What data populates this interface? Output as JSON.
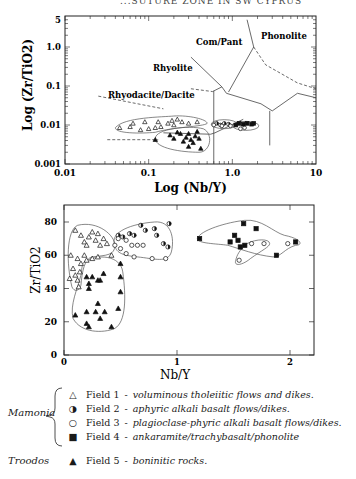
{
  "header": {
    "text": "...SUTURE ZONE IN SW CYPRUS"
  },
  "chart_data": [
    {
      "type": "scatter",
      "title": "",
      "xlabel": "Log (Nb/Y)",
      "ylabel": "Log (Zr/TiO2)",
      "xscale": "log",
      "yscale": "log",
      "xlim": [
        0.01,
        10
      ],
      "ylim": [
        0.001,
        5
      ],
      "x_ticks": [
        "0.01",
        "0.1",
        "1.0",
        "10"
      ],
      "y_ticks": [
        "0.001",
        "0.01",
        "0.1",
        "1.0",
        "5"
      ],
      "grid": false,
      "region_labels": [
        "Phonolite",
        "Com/Pant",
        "Rhyolite",
        "Rhyodacite/Dacite"
      ],
      "series": [
        {
          "name": "Field 1",
          "marker": "open-triangle",
          "points": [
            [
              0.045,
              0.0085
            ],
            [
              0.06,
              0.009
            ],
            [
              0.065,
              0.011
            ],
            [
              0.08,
              0.0075
            ],
            [
              0.09,
              0.012
            ],
            [
              0.1,
              0.008
            ],
            [
              0.12,
              0.0085
            ],
            [
              0.13,
              0.012
            ],
            [
              0.14,
              0.009
            ],
            [
              0.17,
              0.011
            ],
            [
              0.19,
              0.013
            ],
            [
              0.2,
              0.01
            ],
            [
              0.22,
              0.014
            ],
            [
              0.25,
              0.012
            ],
            [
              0.3,
              0.011
            ],
            [
              0.38,
              0.012
            ]
          ]
        },
        {
          "name": "Field 2",
          "marker": "half-circle",
          "points": [
            [
              0.65,
              0.011
            ],
            [
              0.72,
              0.01
            ],
            [
              0.8,
              0.011
            ],
            [
              0.9,
              0.0105
            ]
          ]
        },
        {
          "name": "Field 3",
          "marker": "open-circle",
          "points": [
            [
              0.6,
              0.01
            ],
            [
              0.75,
              0.0095
            ],
            [
              0.95,
              0.0095
            ],
            [
              1.25,
              0.008
            ],
            [
              1.4,
              0.0085
            ]
          ]
        },
        {
          "name": "Field 4",
          "marker": "filled-square",
          "points": [
            [
              1.1,
              0.01
            ],
            [
              1.2,
              0.011
            ],
            [
              1.35,
              0.0105
            ],
            [
              1.5,
              0.011
            ],
            [
              1.7,
              0.0105
            ],
            [
              1.8,
              0.011
            ]
          ]
        },
        {
          "name": "Field 5",
          "marker": "filled-triangle",
          "points": [
            [
              0.12,
              0.0042
            ],
            [
              0.18,
              0.0055
            ],
            [
              0.2,
              0.0045
            ],
            [
              0.22,
              0.0065
            ],
            [
              0.24,
              0.006
            ],
            [
              0.26,
              0.0038
            ],
            [
              0.28,
              0.0048
            ],
            [
              0.3,
              0.006
            ],
            [
              0.32,
              0.0042
            ],
            [
              0.34,
              0.0035
            ],
            [
              0.36,
              0.0052
            ],
            [
              0.38,
              0.0068
            ],
            [
              0.4,
              0.0045
            ],
            [
              0.42,
              0.0025
            ],
            [
              0.3,
              0.0028
            ]
          ]
        }
      ]
    },
    {
      "type": "scatter",
      "title": "",
      "xlabel": "Nb/Y",
      "ylabel": "Zr/TiO2",
      "xlim": [
        0,
        2.2
      ],
      "ylim": [
        0,
        85
      ],
      "x_ticks": [
        "0",
        "1",
        "2"
      ],
      "y_ticks": [
        "0",
        "20",
        "40",
        "60",
        "80"
      ],
      "grid": false,
      "series": [
        {
          "name": "Field 1",
          "marker": "open-triangle",
          "points": [
            [
              0.1,
              75
            ],
            [
              0.15,
              72
            ],
            [
              0.18,
              68
            ],
            [
              0.2,
              66
            ],
            [
              0.22,
              71
            ],
            [
              0.25,
              74
            ],
            [
              0.28,
              69
            ],
            [
              0.3,
              73
            ],
            [
              0.32,
              66
            ],
            [
              0.35,
              70
            ],
            [
              0.38,
              67
            ],
            [
              0.42,
              60
            ],
            [
              0.12,
              58
            ],
            [
              0.15,
              55
            ],
            [
              0.18,
              60
            ],
            [
              0.2,
              57
            ],
            [
              0.25,
              58
            ],
            [
              0.3,
              59
            ],
            [
              0.08,
              52
            ],
            [
              0.1,
              48
            ],
            [
              0.12,
              45
            ],
            [
              0.14,
              50
            ],
            [
              0.13,
              41
            ],
            [
              0.05,
              46
            ],
            [
              0.06,
              60
            ]
          ]
        },
        {
          "name": "Field 2",
          "marker": "half-circle",
          "points": [
            [
              0.48,
              72
            ],
            [
              0.52,
              71
            ],
            [
              0.58,
              73
            ],
            [
              0.62,
              72
            ],
            [
              0.68,
              78
            ],
            [
              0.72,
              75
            ],
            [
              0.8,
              76
            ],
            [
              0.82,
              72
            ],
            [
              0.88,
              67
            ],
            [
              0.92,
              65
            ],
            [
              0.93,
              79
            ]
          ]
        },
        {
          "name": "Field 3",
          "marker": "open-circle",
          "points": [
            [
              0.45,
              66
            ],
            [
              0.5,
              64
            ],
            [
              0.55,
              69
            ],
            [
              0.6,
              66
            ],
            [
              0.65,
              66
            ],
            [
              0.7,
              66
            ],
            [
              0.55,
              61
            ],
            [
              0.62,
              59
            ],
            [
              0.78,
              58
            ],
            [
              0.9,
              58
            ],
            [
              0.48,
              70
            ],
            [
              1.55,
              57
            ],
            [
              1.66,
              67
            ],
            [
              1.77,
              67
            ],
            [
              1.98,
              67
            ]
          ]
        },
        {
          "name": "Field 4",
          "marker": "filled-square",
          "points": [
            [
              1.2,
              70
            ],
            [
              1.47,
              68
            ],
            [
              1.51,
              72
            ],
            [
              1.54,
              69
            ],
            [
              1.56,
              65
            ],
            [
              1.59,
              79
            ],
            [
              1.6,
              66
            ],
            [
              1.7,
              76
            ],
            [
              1.88,
              60
            ],
            [
              2.05,
              68
            ]
          ]
        },
        {
          "name": "Field 5",
          "marker": "filled-triangle",
          "points": [
            [
              0.2,
              47
            ],
            [
              0.25,
              47
            ],
            [
              0.22,
              43
            ],
            [
              0.22,
              40
            ],
            [
              0.3,
              45
            ],
            [
              0.32,
              45
            ],
            [
              0.35,
              49
            ],
            [
              0.5,
              55
            ],
            [
              0.5,
              47
            ],
            [
              0.5,
              38
            ],
            [
              0.3,
              31
            ],
            [
              0.2,
              26
            ],
            [
              0.1,
              24
            ],
            [
              0.28,
              26
            ],
            [
              0.36,
              26
            ],
            [
              0.32,
              22
            ],
            [
              0.48,
              28
            ],
            [
              0.2,
              19
            ],
            [
              0.22,
              17
            ],
            [
              0.42,
              17
            ]
          ]
        }
      ]
    }
  ],
  "legend": {
    "groups": [
      {
        "label": "Mamonia"
      },
      {
        "label": "Troodos"
      }
    ],
    "items": [
      {
        "symbol": "△",
        "field": "Field 1",
        "dash": "-",
        "desc": "voluminous tholeiitic flows and dikes."
      },
      {
        "symbol": "◑",
        "field": "Field 2",
        "dash": "-",
        "desc": "aphyric alkali basalt flows/dikes."
      },
      {
        "symbol": "○",
        "field": "Field 3",
        "dash": "-",
        "desc": "plagioclase-phyric alkali basalt flows/dikes."
      },
      {
        "symbol": "■",
        "field": "Field 4",
        "dash": "-",
        "desc": "ankaramite/trachybasalt/phonolite"
      },
      {
        "symbol": "▲",
        "field": "Field 5",
        "dash": "-",
        "desc": "boninitic rocks."
      }
    ]
  }
}
